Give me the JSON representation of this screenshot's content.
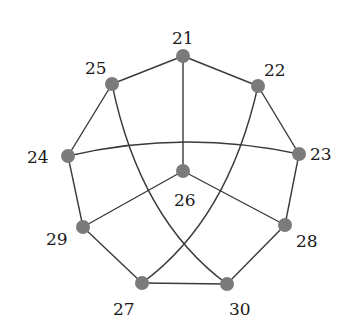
{
  "diagram": {
    "type": "graph",
    "node_color": "#7b7b7b",
    "edge_color": "#3a3a3a",
    "nodes": [
      {
        "id": "21",
        "label": "21",
        "x": 183,
        "y": 56,
        "lx": 172,
        "ly": 44
      },
      {
        "id": "22",
        "label": "22",
        "x": 258,
        "y": 86,
        "lx": 264,
        "ly": 76
      },
      {
        "id": "23",
        "label": "23",
        "x": 299,
        "y": 154,
        "lx": 310,
        "ly": 160
      },
      {
        "id": "24",
        "label": "24",
        "x": 68,
        "y": 156,
        "lx": 27,
        "ly": 163
      },
      {
        "id": "25",
        "label": "25",
        "x": 112,
        "y": 84,
        "lx": 85,
        "ly": 74
      },
      {
        "id": "26",
        "label": "26",
        "x": 183,
        "y": 171,
        "lx": 174,
        "ly": 206
      },
      {
        "id": "27",
        "label": "27",
        "x": 142,
        "y": 283,
        "lx": 113,
        "ly": 315
      },
      {
        "id": "28",
        "label": "28",
        "x": 285,
        "y": 225,
        "lx": 296,
        "ly": 247
      },
      {
        "id": "29",
        "label": "29",
        "x": 83,
        "y": 227,
        "lx": 46,
        "ly": 245
      },
      {
        "id": "30",
        "label": "30",
        "x": 227,
        "y": 284,
        "lx": 229,
        "ly": 315
      }
    ],
    "edges": [
      {
        "from": "21",
        "to": "25",
        "d": "M183,56 L112,84"
      },
      {
        "from": "21",
        "to": "22",
        "d": "M183,56 L258,86"
      },
      {
        "from": "21",
        "to": "26",
        "d": "M183,56 L183,171"
      },
      {
        "from": "25",
        "to": "24",
        "d": "M112,84 L68,156"
      },
      {
        "from": "25",
        "to": "30",
        "d": "M112,84 Q140,220 227,284"
      },
      {
        "from": "22",
        "to": "23",
        "d": "M258,86 L299,154"
      },
      {
        "from": "22",
        "to": "27",
        "d": "M258,86 Q228,220 142,283"
      },
      {
        "from": "24",
        "to": "23",
        "d": "M68,156 Q183,129 299,154"
      },
      {
        "from": "24",
        "to": "29",
        "d": "M68,156 L83,227"
      },
      {
        "from": "23",
        "to": "28",
        "d": "M299,154 L285,225"
      },
      {
        "from": "26",
        "to": "29",
        "d": "M183,171 L83,227"
      },
      {
        "from": "26",
        "to": "28",
        "d": "M183,171 L285,225"
      },
      {
        "from": "29",
        "to": "27",
        "d": "M83,227 L142,283"
      },
      {
        "from": "27",
        "to": "30",
        "d": "M142,283 L227,284"
      },
      {
        "from": "30",
        "to": "28",
        "d": "M227,284 L285,225"
      }
    ]
  }
}
